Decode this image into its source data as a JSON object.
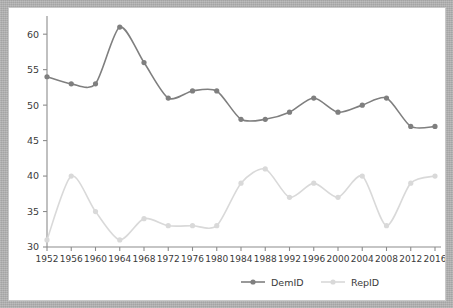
{
  "chart_data": {
    "type": "line",
    "title": "",
    "subtitle": "",
    "xlabel": "",
    "ylabel": "",
    "categories": [
      "1952",
      "1956",
      "1960",
      "1964",
      "1968",
      "1972",
      "1976",
      "1980",
      "1984",
      "1988",
      "1992",
      "1996",
      "2000",
      "2004",
      "2008",
      "2012",
      "2016"
    ],
    "x_tick_labels": [
      "1952",
      "1956",
      "1960",
      "1964",
      "1968",
      "1972",
      "1976",
      "1980",
      "1984",
      "1988",
      "1992",
      "1996",
      "2000",
      "2004",
      "2008",
      "2012",
      "2016"
    ],
    "y_tick_labels": [
      "30",
      "35",
      "40",
      "45",
      "50",
      "55",
      "60"
    ],
    "y_ticks": [
      30,
      35,
      40,
      45,
      50,
      55,
      60
    ],
    "ylim": [
      30,
      62
    ],
    "grid": false,
    "legend_position": "bottom",
    "series": [
      {
        "name": "DemID",
        "color": "#7f7f7f",
        "marker": "circle",
        "values": [
          54,
          53,
          53,
          61,
          56,
          51,
          52,
          52,
          48,
          48,
          49,
          51,
          49,
          50,
          51,
          47,
          47
        ]
      },
      {
        "name": "RepID",
        "color": "#d9d9d9",
        "marker": "circle",
        "values": [
          31,
          40,
          35,
          31,
          34,
          33,
          33,
          33,
          39,
          41,
          37,
          39,
          37,
          40,
          33,
          39,
          40
        ]
      }
    ]
  },
  "legend": {
    "items": [
      {
        "label": "DemID",
        "color": "#7f7f7f"
      },
      {
        "label": "RepID",
        "color": "#d9d9d9"
      }
    ]
  },
  "axes": {
    "y_axis_name": "y-axis",
    "x_axis_name": "x-axis"
  },
  "colors": {
    "panel_background": "#ffffff",
    "frame": "#b3b3b3",
    "axis": "#8c8c8c",
    "text": "#3a3a3a",
    "dem": "#7f7f7f",
    "rep": "#d9d9d9"
  }
}
